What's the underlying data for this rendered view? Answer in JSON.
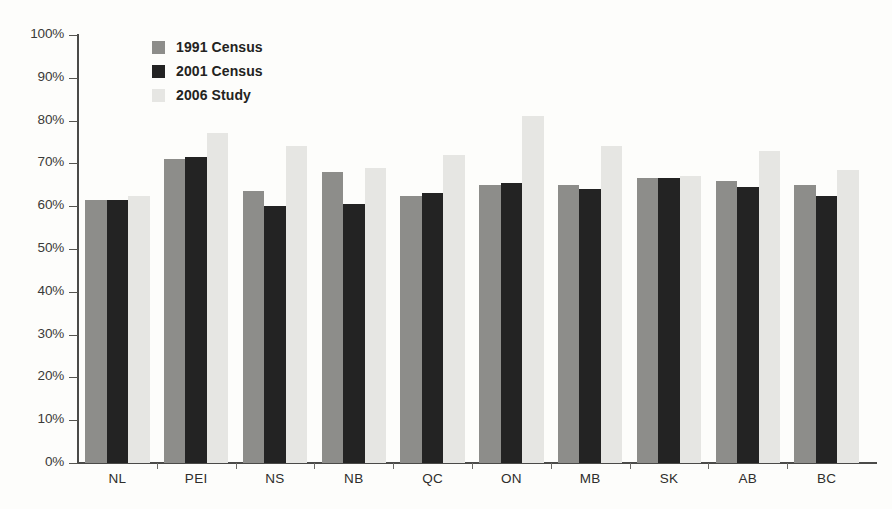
{
  "chart_data": {
    "type": "bar",
    "title": "",
    "subtitle": "",
    "xlabel": "",
    "ylabel": "",
    "ylim": [
      0,
      100
    ],
    "y_tick_labels": [
      "100%",
      "90%",
      "80%",
      "70%",
      "60%",
      "50%",
      "40%",
      "30%",
      "20%",
      "10%",
      "0%"
    ],
    "y_tick_values": [
      100,
      90,
      80,
      70,
      60,
      50,
      40,
      30,
      20,
      10,
      0
    ],
    "grid": false,
    "legend_position": "top-left-inside",
    "categories": [
      "NL",
      "PEI",
      "NS",
      "NB",
      "QC",
      "ON",
      "MB",
      "SK",
      "AB",
      "BC"
    ],
    "series": [
      {
        "name": "1991 Census",
        "color": "#8d8d8a",
        "values": [
          61.5,
          71.0,
          63.5,
          68.0,
          62.5,
          65.0,
          65.0,
          66.5,
          66.0,
          65.0
        ]
      },
      {
        "name": "2001 Census",
        "color": "#232323",
        "values": [
          61.5,
          71.5,
          60.0,
          60.5,
          63.0,
          65.5,
          64.0,
          66.5,
          64.5,
          62.5
        ]
      },
      {
        "name": "2006 Study",
        "color": "#e6e6e3",
        "values": [
          62.5,
          77.0,
          74.0,
          69.0,
          72.0,
          81.0,
          74.0,
          67.0,
          73.0,
          68.5
        ]
      }
    ],
    "annotations": []
  },
  "legend": {
    "entries": [
      {
        "label": "1991 Census"
      },
      {
        "label": "2001 Census"
      },
      {
        "label": "2006 Study"
      }
    ]
  }
}
